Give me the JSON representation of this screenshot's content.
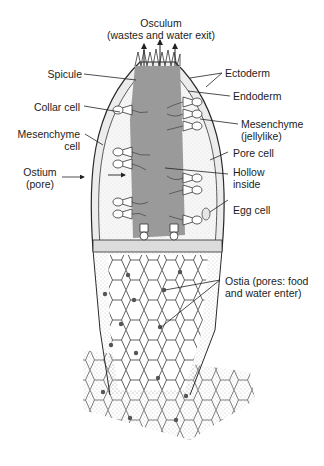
{
  "diagram": {
    "colors": {
      "background": "#ffffff",
      "line": "#2a2a2a",
      "cavity": "#9a9a9a",
      "stipple": "#8a8a8a",
      "pore_dot": "#555555"
    },
    "labels": {
      "osculum_line1": "Osculum",
      "osculum_line2": "(wastes and water exit)",
      "spicule": "Spicule",
      "ectoderm": "Ectoderm",
      "endoderm": "Endoderm",
      "collar_cell": "Collar cell",
      "mesenchyme_jelly_line1": "Mesenchyme",
      "mesenchyme_jelly_line2": "(jellylike)",
      "mesenchyme_cell_line1": "Mesenchyme",
      "mesenchyme_cell_line2": "cell",
      "pore_cell": "Pore cell",
      "ostium_line1": "Ostium",
      "ostium_line2": "(pore)",
      "hollow_line1": "Hollow",
      "hollow_line2": "inside",
      "egg_cell": "Egg cell",
      "ostia_line1": "Ostia (pores: food",
      "ostia_line2": "and water enter)"
    }
  }
}
